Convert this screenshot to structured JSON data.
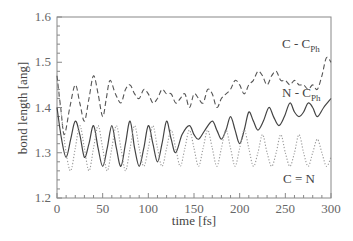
{
  "chart_data": {
    "type": "line",
    "title": "",
    "xlabel": "time [fs]",
    "ylabel": "bond length [ang]",
    "xlim": [
      0,
      300
    ],
    "ylim": [
      1.2,
      1.6
    ],
    "xticks": [
      0,
      50,
      100,
      150,
      200,
      250,
      300
    ],
    "yticks": [
      1.2,
      1.3,
      1.4,
      1.5,
      1.6
    ],
    "xtick_labels": [
      "0",
      "50",
      "100",
      "150",
      "200",
      "250",
      "300"
    ],
    "ytick_labels": [
      "1.2",
      "1.3",
      "1.4",
      "1.5",
      "1.6"
    ],
    "grid": false,
    "legend_position": "inline labels on right",
    "series": [
      {
        "name": "C - C_Ph",
        "label_main": "C - C",
        "label_sub": "Ph",
        "style": "dashed",
        "x": [
          0,
          4,
          8,
          14,
          20,
          25,
          30,
          35,
          40,
          45,
          50,
          54,
          58,
          64,
          70,
          75,
          80,
          85,
          90,
          95,
          100,
          105,
          110,
          115,
          120,
          125,
          130,
          135,
          140,
          145,
          150,
          155,
          160,
          165,
          170,
          175,
          180,
          185,
          190,
          195,
          200,
          205,
          210,
          215,
          220,
          225,
          230,
          235,
          240,
          245,
          250,
          255,
          260,
          265,
          270,
          275,
          280,
          285,
          290,
          295,
          300
        ],
        "y": [
          1.47,
          1.4,
          1.34,
          1.4,
          1.45,
          1.41,
          1.37,
          1.42,
          1.47,
          1.43,
          1.38,
          1.42,
          1.46,
          1.43,
          1.41,
          1.44,
          1.45,
          1.43,
          1.42,
          1.44,
          1.43,
          1.41,
          1.42,
          1.44,
          1.43,
          1.43,
          1.41,
          1.42,
          1.43,
          1.4,
          1.43,
          1.42,
          1.41,
          1.44,
          1.43,
          1.4,
          1.42,
          1.43,
          1.44,
          1.46,
          1.45,
          1.43,
          1.45,
          1.46,
          1.48,
          1.47,
          1.45,
          1.47,
          1.48,
          1.46,
          1.46,
          1.45,
          1.46,
          1.45,
          1.45,
          1.44,
          1.45,
          1.44,
          1.47,
          1.51,
          1.5
        ]
      },
      {
        "name": "N - C_Ph",
        "label_main": "N - C",
        "label_sub": "Ph",
        "style": "solid",
        "x": [
          0,
          5,
          10,
          15,
          20,
          25,
          30,
          35,
          40,
          45,
          50,
          55,
          60,
          65,
          70,
          75,
          80,
          85,
          90,
          95,
          100,
          105,
          110,
          115,
          120,
          125,
          130,
          137,
          145,
          150,
          155,
          162,
          170,
          175,
          180,
          185,
          190,
          195,
          200,
          205,
          210,
          215,
          220,
          226,
          232,
          237,
          243,
          249,
          255,
          260,
          265,
          270,
          275,
          280,
          285,
          292,
          300
        ],
        "y": [
          1.4,
          1.33,
          1.29,
          1.33,
          1.37,
          1.34,
          1.29,
          1.32,
          1.36,
          1.31,
          1.27,
          1.31,
          1.36,
          1.31,
          1.27,
          1.32,
          1.37,
          1.31,
          1.27,
          1.31,
          1.36,
          1.32,
          1.28,
          1.32,
          1.37,
          1.33,
          1.3,
          1.34,
          1.36,
          1.34,
          1.33,
          1.35,
          1.37,
          1.35,
          1.33,
          1.35,
          1.38,
          1.35,
          1.32,
          1.35,
          1.39,
          1.37,
          1.35,
          1.37,
          1.4,
          1.38,
          1.36,
          1.38,
          1.41,
          1.39,
          1.38,
          1.39,
          1.41,
          1.4,
          1.38,
          1.4,
          1.42
        ]
      },
      {
        "name": "C = N",
        "label_main": "C = N",
        "label_sub": "",
        "style": "dotted",
        "x": [
          0,
          5,
          10,
          15,
          20,
          25,
          30,
          35,
          40,
          45,
          50,
          55,
          60,
          65,
          70,
          75,
          80,
          85,
          90,
          95,
          100,
          105,
          110,
          115,
          120,
          125,
          130,
          135,
          140,
          145,
          150,
          155,
          160,
          165,
          170,
          175,
          180,
          185,
          190,
          195,
          200,
          205,
          210,
          215,
          220,
          225,
          230,
          235,
          240,
          245,
          250,
          255,
          260,
          265,
          270,
          275,
          280,
          285,
          290,
          295,
          300
        ],
        "y": [
          1.46,
          1.38,
          1.3,
          1.26,
          1.31,
          1.36,
          1.31,
          1.26,
          1.31,
          1.36,
          1.31,
          1.26,
          1.31,
          1.36,
          1.31,
          1.26,
          1.31,
          1.36,
          1.31,
          1.27,
          1.31,
          1.36,
          1.31,
          1.27,
          1.31,
          1.35,
          1.31,
          1.27,
          1.31,
          1.35,
          1.31,
          1.27,
          1.31,
          1.35,
          1.31,
          1.27,
          1.31,
          1.35,
          1.31,
          1.27,
          1.31,
          1.35,
          1.31,
          1.27,
          1.3,
          1.34,
          1.3,
          1.27,
          1.3,
          1.34,
          1.3,
          1.27,
          1.3,
          1.34,
          1.3,
          1.27,
          1.3,
          1.33,
          1.3,
          1.27,
          1.29
        ]
      }
    ]
  },
  "labels": {
    "c_cph": "C - C",
    "c_cph_sub": "Ph",
    "n_cph": "N - C",
    "n_cph_sub": "Ph",
    "c_n": "C = N"
  },
  "colors": {
    "axis": "#777777",
    "line": "#555555",
    "dotted": "#999999"
  }
}
